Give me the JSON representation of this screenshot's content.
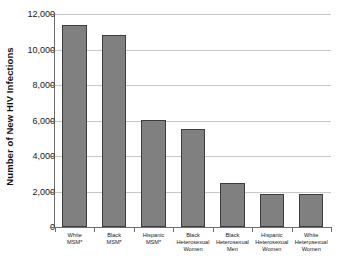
{
  "chart_data": {
    "type": "bar",
    "title": "",
    "xlabel": "",
    "ylabel": "Number of New HIV Infections",
    "ylim": [
      0,
      12000
    ],
    "yticks": [
      "0",
      "2,000",
      "4,000",
      "6,000",
      "8,000",
      "10,000",
      "12,000"
    ],
    "ytick_values": [
      0,
      2000,
      4000,
      6000,
      8000,
      10000,
      12000
    ],
    "grid": "horizontal",
    "legend": "none",
    "bar_color": "#808080",
    "bar_edge_color": "#3d3d3d",
    "gridline_color": "#c8c8c8",
    "axis_color": "#6e6e6e",
    "background_color": "#ffffff",
    "categories": [
      "White MSM*",
      "Black MSM*",
      "Hispanic MSM*",
      "Black Heterosexual Women",
      "Black Heterosexual Men",
      "Hispanic Heterosexual Women",
      "White Heterosexual Women"
    ],
    "category_lines": [
      [
        "White",
        "MSM*"
      ],
      [
        "Black",
        "MSM*"
      ],
      [
        "Hispanic",
        "MSM*"
      ],
      [
        "Black",
        "Heterosexual",
        "Women"
      ],
      [
        "Black",
        "Heterosexual",
        "Men"
      ],
      [
        "Hispanic",
        "Heterosexual",
        "Women"
      ],
      [
        "White",
        "Heterosexual",
        "Women"
      ]
    ],
    "values": [
      11400,
      10800,
      6050,
      5500,
      2500,
      1850,
      1850
    ]
  }
}
